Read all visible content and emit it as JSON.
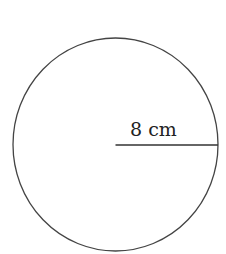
{
  "diagram": {
    "shape": "circle",
    "center": {
      "x": 115.5,
      "y": 144.5
    },
    "radius_px": {
      "rx": 102.5,
      "ry": 106.5
    },
    "stroke_color": "#444444",
    "radius_line": {
      "x1": 115.5,
      "y1": 145,
      "x2": 218,
      "y2": 145,
      "color": "#333333"
    },
    "radius_label": "8 cm"
  }
}
